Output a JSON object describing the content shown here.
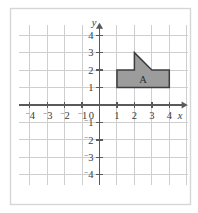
{
  "figure": {
    "background_color": "#ffffff",
    "frame_color": "#d6d6d6"
  },
  "chart_data": {
    "type": "scatter",
    "title": "",
    "xlabel": "x",
    "ylabel": "y",
    "xlim": [
      -4.6,
      5.1
    ],
    "ylim": [
      -4.6,
      4.6
    ],
    "grid": true,
    "grid_color": "#cfcfcf",
    "grid_spacing": 1,
    "axis_color": "#595959",
    "legend": "none",
    "x_ticks": [
      -4,
      -3,
      -2,
      -1,
      1,
      2,
      3,
      4
    ],
    "y_ticks": [
      -4,
      -3,
      -2,
      -1,
      1,
      2,
      3,
      4
    ],
    "x_tick_labels": [
      "⁻4",
      "⁻3",
      "⁻2",
      "⁻1",
      "1",
      "2",
      "3",
      "4"
    ],
    "y_tick_labels": [
      "⁻4",
      "⁻3",
      "⁻2",
      "⁻1",
      "1",
      "2",
      "3",
      "4"
    ],
    "origin_label": "0",
    "x_axis_label": "x",
    "y_axis_label": "y",
    "shapes": [
      {
        "name": "A",
        "label": "A",
        "fill": "#9c9c9c",
        "stroke": "#3d3d3d",
        "label_position": [
          2.5,
          1.45
        ],
        "vertices": [
          [
            1,
            1
          ],
          [
            1,
            2
          ],
          [
            2,
            2
          ],
          [
            2,
            3
          ],
          [
            3,
            2
          ],
          [
            4,
            2
          ],
          [
            4,
            1
          ]
        ]
      }
    ]
  },
  "ticks": {
    "x": [
      {
        "value": -4,
        "sign": "⁻",
        "digit": "4"
      },
      {
        "value": -3,
        "sign": "⁻",
        "digit": "3"
      },
      {
        "value": -2,
        "sign": "⁻",
        "digit": "2"
      },
      {
        "value": -1,
        "sign": "⁻",
        "digit": "1"
      },
      {
        "value": 1,
        "sign": "",
        "digit": "1"
      },
      {
        "value": 2,
        "sign": "",
        "digit": "2"
      },
      {
        "value": 3,
        "sign": "",
        "digit": "3"
      },
      {
        "value": 4,
        "sign": "",
        "digit": "4"
      }
    ],
    "y": [
      {
        "value": 4,
        "sign": "",
        "digit": "4"
      },
      {
        "value": 3,
        "sign": "",
        "digit": "3"
      },
      {
        "value": 2,
        "sign": "",
        "digit": "2"
      },
      {
        "value": 1,
        "sign": "",
        "digit": "1"
      },
      {
        "value": -1,
        "sign": "⁻",
        "digit": "1"
      },
      {
        "value": -2,
        "sign": "⁻",
        "digit": "2"
      },
      {
        "value": -3,
        "sign": "⁻",
        "digit": "3"
      },
      {
        "value": -4,
        "sign": "⁻",
        "digit": "4"
      }
    ],
    "origin": "0"
  },
  "labels": {
    "x_axis": "x",
    "y_axis": "y",
    "shape_a": "A"
  }
}
